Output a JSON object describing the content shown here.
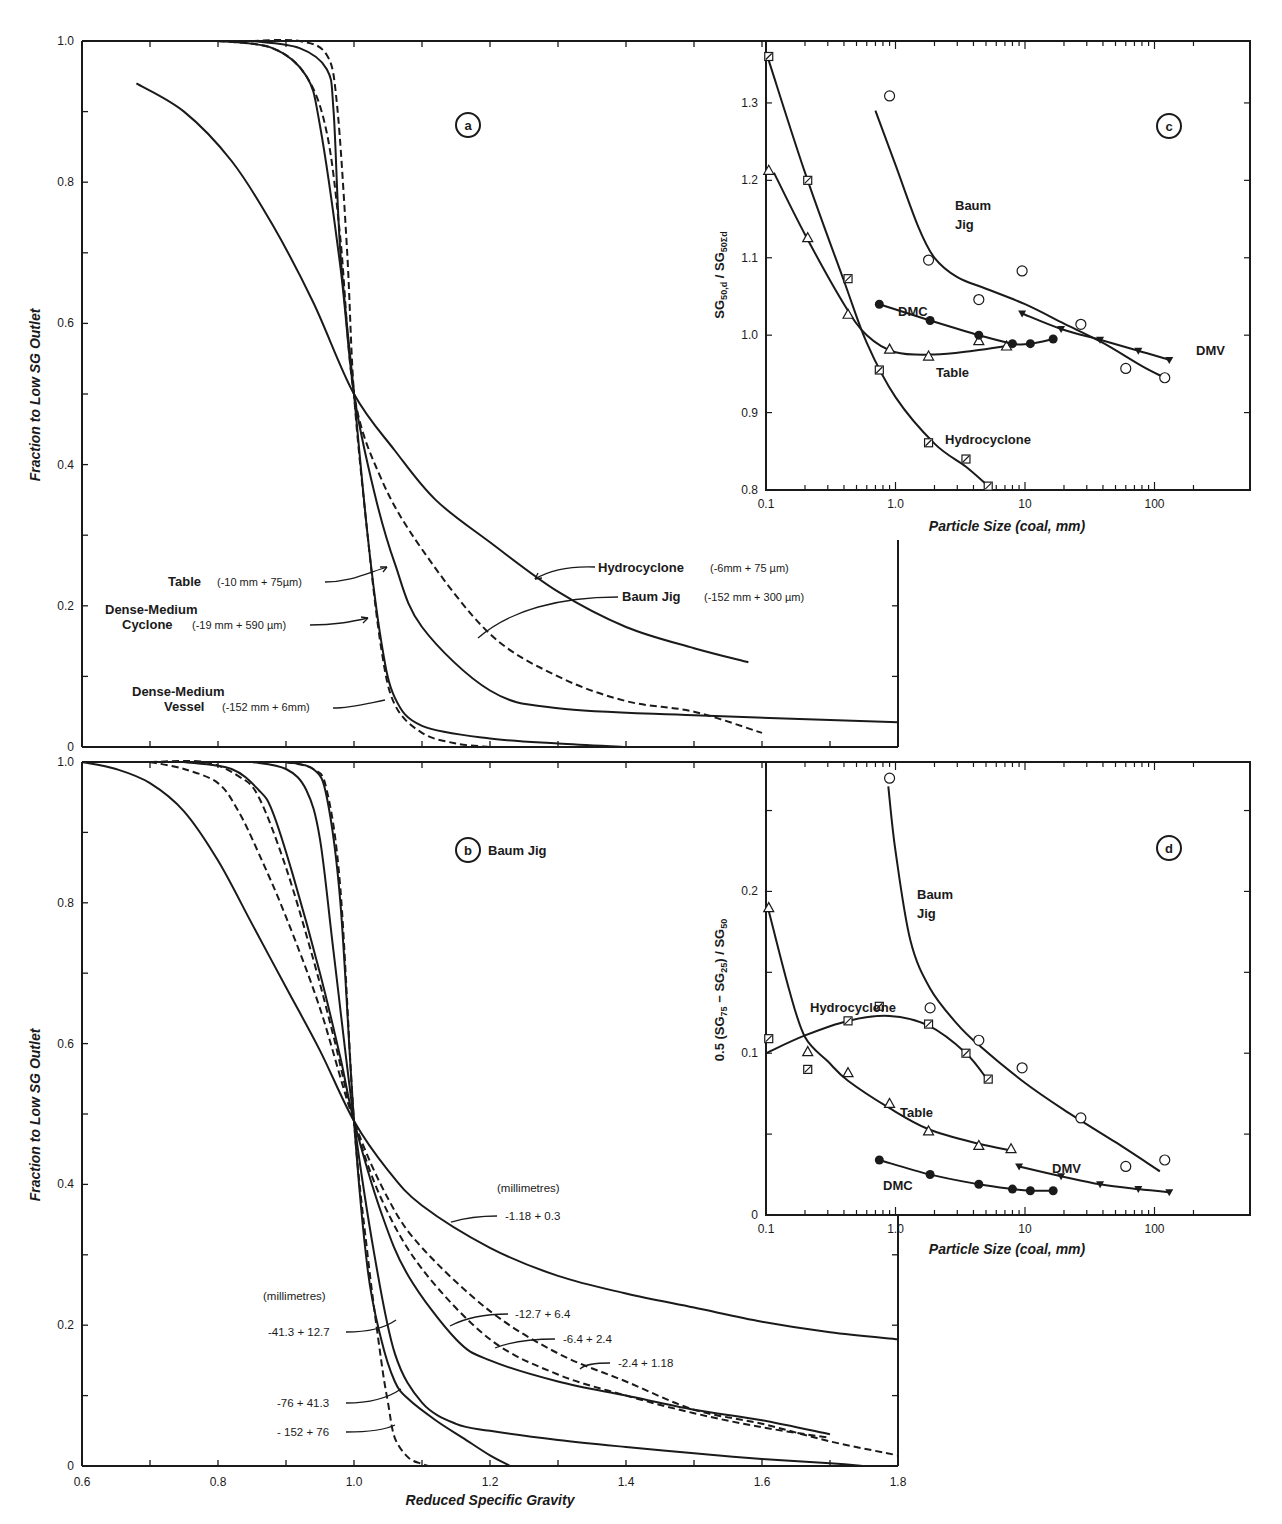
{
  "figure": {
    "panels": [
      "a",
      "b",
      "c",
      "d"
    ]
  },
  "chart_data": [
    {
      "id": "a",
      "type": "line",
      "title": "",
      "panel_label": "a",
      "xlabel": "",
      "ylabel": "Fraction to Low SG Outlet",
      "xlim": [
        0.6,
        1.8
      ],
      "ylim": [
        0,
        1.0
      ],
      "yticks": [
        0,
        0.2,
        0.4,
        0.6,
        0.8,
        1.0
      ],
      "yticklabels": [
        "0",
        "0.2",
        "0.4",
        "0.6",
        "0.8",
        "1.0"
      ],
      "grid": false,
      "series": [
        {
          "name": "Hydrocyclone",
          "size_range": "(-6mm + 75 µm)",
          "style": "solid",
          "x": [
            0.68,
            0.75,
            0.82,
            0.88,
            0.94,
            1.0,
            1.06,
            1.12,
            1.2,
            1.3,
            1.4,
            1.5,
            1.58
          ],
          "y": [
            0.94,
            0.9,
            0.83,
            0.74,
            0.63,
            0.5,
            0.42,
            0.35,
            0.29,
            0.22,
            0.17,
            0.14,
            0.12
          ]
        },
        {
          "name": "Baum Jig",
          "size_range": "(-152 mm + 300 µm)",
          "style": "dashed",
          "x": [
            0.8,
            0.88,
            0.93,
            0.96,
            0.98,
            1.0,
            1.04,
            1.1,
            1.2,
            1.3,
            1.4,
            1.5,
            1.6
          ],
          "y": [
            1.0,
            0.99,
            0.95,
            0.87,
            0.72,
            0.5,
            0.38,
            0.28,
            0.16,
            0.1,
            0.065,
            0.05,
            0.02
          ]
        },
        {
          "name": "Table",
          "size_range": "(-10 mm + 75 µm)",
          "style": "solid",
          "x": [
            0.8,
            0.88,
            0.93,
            0.95,
            0.98,
            1.0,
            1.03,
            1.06,
            1.1,
            1.2,
            1.3,
            1.5,
            1.8
          ],
          "y": [
            1.0,
            0.99,
            0.95,
            0.88,
            0.68,
            0.5,
            0.36,
            0.26,
            0.17,
            0.08,
            0.055,
            0.045,
            0.035
          ]
        },
        {
          "name": "Dense-Medium Cyclone",
          "size_range": "(-19 mm + 590 µm)",
          "style": "solid",
          "x": [
            0.85,
            0.92,
            0.96,
            0.97,
            0.98,
            1.0,
            1.02,
            1.04,
            1.06,
            1.1,
            1.2,
            1.3,
            1.4
          ],
          "y": [
            1.0,
            0.99,
            0.96,
            0.9,
            0.7,
            0.5,
            0.3,
            0.15,
            0.07,
            0.03,
            0.012,
            0.005,
            0.0
          ]
        },
        {
          "name": "Dense-Medium Vessel",
          "size_range": "(-152 mm + 6mm)",
          "style": "dashed",
          "x": [
            0.85,
            0.92,
            0.96,
            0.975,
            0.99,
            1.0,
            1.02,
            1.04,
            1.06,
            1.1,
            1.15,
            1.2
          ],
          "y": [
            1.0,
            1.0,
            0.98,
            0.91,
            0.7,
            0.5,
            0.3,
            0.14,
            0.06,
            0.02,
            0.005,
            0.0
          ]
        }
      ],
      "annotations": [
        "Table (-10 mm + 75µm)",
        "Dense-Medium Cyclone (-19 mm + 590 µm)",
        "Dense-Medium Vessel (-152 mm + 6mm)",
        "Hydrocyclone (-6mm + 75 µm)",
        "Baum Jig (-152 mm + 300 µm)"
      ]
    },
    {
      "id": "b",
      "type": "line",
      "title": "Baum Jig",
      "panel_label": "b",
      "xlabel": "Reduced Specific Gravity",
      "ylabel": "Fraction to Low SG Outlet",
      "xlim": [
        0.6,
        1.8
      ],
      "ylim": [
        0,
        1.0
      ],
      "xticks": [
        0.6,
        0.8,
        1.0,
        1.2,
        1.4,
        1.6,
        1.8
      ],
      "xticklabels": [
        "0.6",
        "0.8",
        "1.0",
        "1.2",
        "1.4",
        "1.6",
        "1.8"
      ],
      "yticks": [
        0,
        0.2,
        0.4,
        0.6,
        0.8,
        1.0
      ],
      "yticklabels": [
        "0",
        "0.2",
        "0.4",
        "0.6",
        "0.8",
        "1.0"
      ],
      "grid": false,
      "unit_note": "(millimetres)",
      "series": [
        {
          "name": "-1.18 + 0.3",
          "style": "solid",
          "x": [
            0.6,
            0.65,
            0.7,
            0.75,
            0.8,
            0.85,
            0.9,
            0.95,
            1.0,
            1.05,
            1.1,
            1.2,
            1.3,
            1.4,
            1.5,
            1.6,
            1.7,
            1.8
          ],
          "y": [
            1.0,
            0.99,
            0.97,
            0.93,
            0.86,
            0.77,
            0.68,
            0.59,
            0.49,
            0.42,
            0.37,
            0.31,
            0.27,
            0.245,
            0.225,
            0.205,
            0.19,
            0.18
          ]
        },
        {
          "name": "-2.4 + 1.18",
          "style": "dashed",
          "x": [
            0.7,
            0.75,
            0.8,
            0.83,
            0.86,
            0.9,
            0.95,
            1.0,
            1.05,
            1.1,
            1.2,
            1.3,
            1.4,
            1.5,
            1.6,
            1.7,
            1.8
          ],
          "y": [
            1.0,
            0.99,
            0.97,
            0.93,
            0.87,
            0.78,
            0.65,
            0.49,
            0.38,
            0.31,
            0.22,
            0.16,
            0.12,
            0.08,
            0.06,
            0.035,
            0.015
          ]
        },
        {
          "name": "-6.4 + 2.4",
          "style": "dashed",
          "x": [
            0.7,
            0.78,
            0.83,
            0.86,
            0.9,
            0.94,
            0.97,
            1.0,
            1.04,
            1.1,
            1.2,
            1.3,
            1.4,
            1.5,
            1.6,
            1.7
          ],
          "y": [
            1.0,
            1.0,
            0.98,
            0.95,
            0.85,
            0.72,
            0.61,
            0.49,
            0.38,
            0.28,
            0.18,
            0.13,
            0.1,
            0.075,
            0.055,
            0.04
          ]
        },
        {
          "name": "-12.7 + 6.4",
          "style": "solid",
          "x": [
            0.75,
            0.82,
            0.86,
            0.88,
            0.91,
            0.95,
            0.98,
            1.0,
            1.04,
            1.08,
            1.15,
            1.2,
            1.3,
            1.4,
            1.5,
            1.6,
            1.7
          ],
          "y": [
            1.0,
            0.99,
            0.96,
            0.93,
            0.84,
            0.7,
            0.58,
            0.49,
            0.36,
            0.27,
            0.18,
            0.15,
            0.12,
            0.1,
            0.08,
            0.065,
            0.045
          ]
        },
        {
          "name": "-41.3 + 12.7",
          "style": "solid",
          "x": [
            0.85,
            0.9,
            0.93,
            0.95,
            0.97,
            1.0,
            1.03,
            1.06,
            1.1,
            1.15,
            1.2,
            1.3,
            1.4,
            1.5,
            1.6,
            1.7,
            1.75
          ],
          "y": [
            1.0,
            0.99,
            0.96,
            0.89,
            0.73,
            0.49,
            0.3,
            0.16,
            0.09,
            0.06,
            0.05,
            0.037,
            0.027,
            0.018,
            0.01,
            0.004,
            0.0
          ]
        },
        {
          "name": "-76 + 41.3",
          "style": "solid",
          "x": [
            0.9,
            0.94,
            0.96,
            0.98,
            1.0,
            1.02,
            1.04,
            1.06,
            1.08,
            1.12,
            1.16,
            1.2,
            1.23
          ],
          "y": [
            1.0,
            0.99,
            0.95,
            0.8,
            0.49,
            0.28,
            0.18,
            0.12,
            0.095,
            0.065,
            0.04,
            0.015,
            0.0
          ]
        },
        {
          "name": "-152 + 76",
          "style": "dashed",
          "x": [
            0.9,
            0.94,
            0.96,
            0.98,
            1.0,
            1.02,
            1.04,
            1.05,
            1.06,
            1.08,
            1.1,
            1.11
          ],
          "y": [
            1.0,
            0.99,
            0.96,
            0.82,
            0.49,
            0.3,
            0.15,
            0.09,
            0.04,
            0.012,
            0.003,
            0.0
          ]
        }
      ]
    },
    {
      "id": "c",
      "type": "scatter",
      "panel_label": "c",
      "xlabel": "Particle Size (coal, mm)",
      "ylabel": "SG50,d / SG50Σd",
      "xscale": "log",
      "xlim": [
        0.1,
        200
      ],
      "ylim": [
        0.8,
        1.38
      ],
      "xticks": [
        0.1,
        1.0,
        10,
        100
      ],
      "xticklabels": [
        "0.1",
        "1.0",
        "10",
        "100"
      ],
      "yticks": [
        0.8,
        0.9,
        1.0,
        1.1,
        1.2,
        1.3
      ],
      "yticklabels": [
        "0.8",
        "0.9",
        "1.0",
        "1.1",
        "1.2",
        "1.3"
      ],
      "grid": false,
      "series": [
        {
          "name": "Hydrocyclone",
          "marker": "hatched-square",
          "x": [
            0.105,
            0.21,
            0.43,
            0.75,
            1.8,
            3.5,
            5.2
          ],
          "y": [
            1.36,
            1.2,
            1.073,
            0.955,
            0.861,
            0.84,
            0.805
          ],
          "curve_x": [
            0.105,
            0.2,
            0.4,
            0.6,
            1.0,
            2.0,
            3.5,
            5.2
          ],
          "curve_y": [
            1.355,
            1.21,
            1.07,
            0.99,
            0.92,
            0.86,
            0.83,
            0.805
          ]
        },
        {
          "name": "Table",
          "marker": "triangle",
          "x": [
            0.105,
            0.21,
            0.43,
            0.9,
            1.8,
            4.4,
            7.2
          ],
          "y": [
            1.213,
            1.126,
            1.027,
            0.982,
            0.973,
            0.993,
            0.986
          ],
          "curve_x": [
            0.115,
            0.2,
            0.4,
            0.6,
            1.0,
            2.0,
            4.0,
            7.2
          ],
          "curve_y": [
            1.21,
            1.13,
            1.04,
            1.0,
            0.978,
            0.975,
            0.98,
            0.986
          ]
        },
        {
          "name": "DMC",
          "marker": "filled-circle",
          "x": [
            0.75,
            1.85,
            4.4,
            8.0,
            11.0,
            16.5
          ],
          "y": [
            1.04,
            1.019,
            1.0,
            0.989,
            0.989,
            0.995
          ],
          "curve_x": [
            0.75,
            1.85,
            4.4,
            8.0,
            11.0,
            16.5
          ],
          "curve_y": [
            1.04,
            1.019,
            1.0,
            0.989,
            0.989,
            0.995
          ]
        },
        {
          "name": "Baum Jig",
          "marker": "open-circle",
          "x": [
            0.9,
            1.8,
            4.4,
            9.5,
            27,
            60,
            120
          ],
          "y": [
            1.309,
            1.097,
            1.046,
            1.083,
            1.014,
            0.957,
            0.945
          ],
          "curve_x": [
            0.7,
            1.0,
            1.5,
            2.0,
            3.0,
            5.0,
            10,
            20,
            40,
            80,
            120
          ],
          "curve_y": [
            1.29,
            1.22,
            1.14,
            1.1,
            1.075,
            1.06,
            1.04,
            1.015,
            0.99,
            0.96,
            0.945
          ]
        },
        {
          "name": "DMV",
          "marker": "filled-triangle-down",
          "x": [
            9.5,
            19,
            38,
            75,
            130
          ],
          "y": [
            1.028,
            1.008,
            0.994,
            0.98,
            0.968
          ],
          "curve_x": [
            9.5,
            19,
            38,
            75,
            130
          ],
          "curve_y": [
            1.028,
            1.008,
            0.994,
            0.98,
            0.968
          ]
        }
      ]
    },
    {
      "id": "d",
      "type": "scatter",
      "panel_label": "d",
      "xlabel": "Particle Size (coal, mm)",
      "ylabel": "0.5 (SG75 - SG25) / SG50",
      "xscale": "log",
      "xlim": [
        0.1,
        200
      ],
      "ylim": [
        0,
        0.28
      ],
      "xticks": [
        0.1,
        1.0,
        10,
        100
      ],
      "xticklabels": [
        "0.1",
        "1.0",
        "10",
        "100"
      ],
      "yticks": [
        0,
        0.1,
        0.2
      ],
      "yticklabels": [
        "0",
        "0.1",
        "0.2"
      ],
      "grid": false,
      "series": [
        {
          "name": "Hydrocyclone",
          "marker": "hatched-square",
          "x": [
            0.105,
            0.21,
            0.43,
            0.75,
            1.8,
            3.5,
            5.2
          ],
          "y": [
            0.109,
            0.09,
            0.12,
            0.129,
            0.118,
            0.1,
            0.084
          ],
          "curve_x": [
            0.1,
            0.2,
            0.43,
            0.9,
            1.8,
            3.5,
            5.2
          ],
          "curve_y": [
            0.1,
            0.111,
            0.12,
            0.123,
            0.117,
            0.1,
            0.083
          ]
        },
        {
          "name": "Table",
          "marker": "triangle",
          "x": [
            0.105,
            0.21,
            0.43,
            0.9,
            1.8,
            4.4,
            7.8
          ],
          "y": [
            0.19,
            0.101,
            0.088,
            0.069,
            0.052,
            0.043,
            0.041
          ],
          "curve_x": [
            0.105,
            0.15,
            0.2,
            0.3,
            0.43,
            0.9,
            1.8,
            4.4,
            7.8
          ],
          "curve_y": [
            0.188,
            0.14,
            0.11,
            0.095,
            0.083,
            0.066,
            0.053,
            0.044,
            0.04
          ]
        },
        {
          "name": "Baum Jig",
          "marker": "open-circle",
          "x": [
            0.9,
            1.85,
            4.4,
            9.5,
            27,
            60,
            120
          ],
          "y": [
            0.27,
            0.128,
            0.108,
            0.091,
            0.06,
            0.03,
            0.034
          ],
          "curve_x": [
            0.88,
            1.0,
            1.3,
            1.85,
            3.0,
            4.4,
            9.5,
            20,
            50,
            110
          ],
          "curve_y": [
            0.265,
            0.225,
            0.17,
            0.14,
            0.118,
            0.105,
            0.083,
            0.065,
            0.045,
            0.027
          ]
        },
        {
          "name": "DMV",
          "marker": "filled-triangle-down",
          "x": [
            9.0,
            19,
            38,
            75,
            130
          ],
          "y": [
            0.03,
            0.024,
            0.019,
            0.016,
            0.014
          ],
          "curve_x": [
            9.0,
            19,
            38,
            75,
            130
          ],
          "curve_y": [
            0.03,
            0.024,
            0.019,
            0.016,
            0.014
          ]
        },
        {
          "name": "DMC",
          "marker": "filled-circle",
          "x": [
            0.75,
            1.85,
            4.4,
            8.0,
            11.0,
            16.5
          ],
          "y": [
            0.034,
            0.025,
            0.019,
            0.016,
            0.015,
            0.015
          ],
          "curve_x": [
            0.75,
            1.85,
            4.4,
            8.0,
            11.0,
            16.5
          ],
          "curve_y": [
            0.034,
            0.025,
            0.019,
            0.016,
            0.015,
            0.015
          ]
        }
      ]
    }
  ],
  "labels": {
    "a": {
      "panel": "a",
      "ylabel": "Fraction to Low SG Outlet",
      "table": "Table",
      "table_range": "(-10 mm + 75µm)",
      "dmc_1": "Dense-Medium",
      "dmc_2": "Cyclone",
      "dmc_range": "(-19 mm + 590 µm)",
      "dmv_1": "Dense-Medium",
      "dmv_2": "Vessel",
      "dmv_range": "(-152 mm + 6mm)",
      "hydro": "Hydrocyclone",
      "hydro_range": "(-6mm + 75 µm)",
      "baum": "Baum Jig",
      "baum_range": "(-152 mm + 300 µm)"
    },
    "b": {
      "panel": "b",
      "title": "Baum Jig",
      "ylabel": "Fraction to Low SG Outlet",
      "xlabel": "Reduced Specific Gravity",
      "mm_top": "(millimetres)",
      "mm_left": "(millimetres)",
      "s1": "-1.18 + 0.3",
      "s2": "-12.7 + 6.4",
      "s3": "-6.4 + 2.4",
      "s4": "-2.4 + 1.18",
      "s5": "-41.3 + 12.7",
      "s6": "-76 + 41.3",
      "s7": "- 152 + 76"
    },
    "c": {
      "panel": "c",
      "xlabel": "Particle Size (coal, mm)",
      "baum_1": "Baum",
      "baum_2": "Jig",
      "dmc": "DMC",
      "table": "Table",
      "hydro": "Hydrocyclone",
      "dmv": "DMV"
    },
    "d": {
      "panel": "d",
      "xlabel": "Particle Size (coal, mm)",
      "baum_1": "Baum",
      "baum_2": "Jig",
      "hydro": "Hydrocyclone",
      "table": "Table",
      "dmv": "DMV",
      "dmc": "DMC"
    }
  }
}
